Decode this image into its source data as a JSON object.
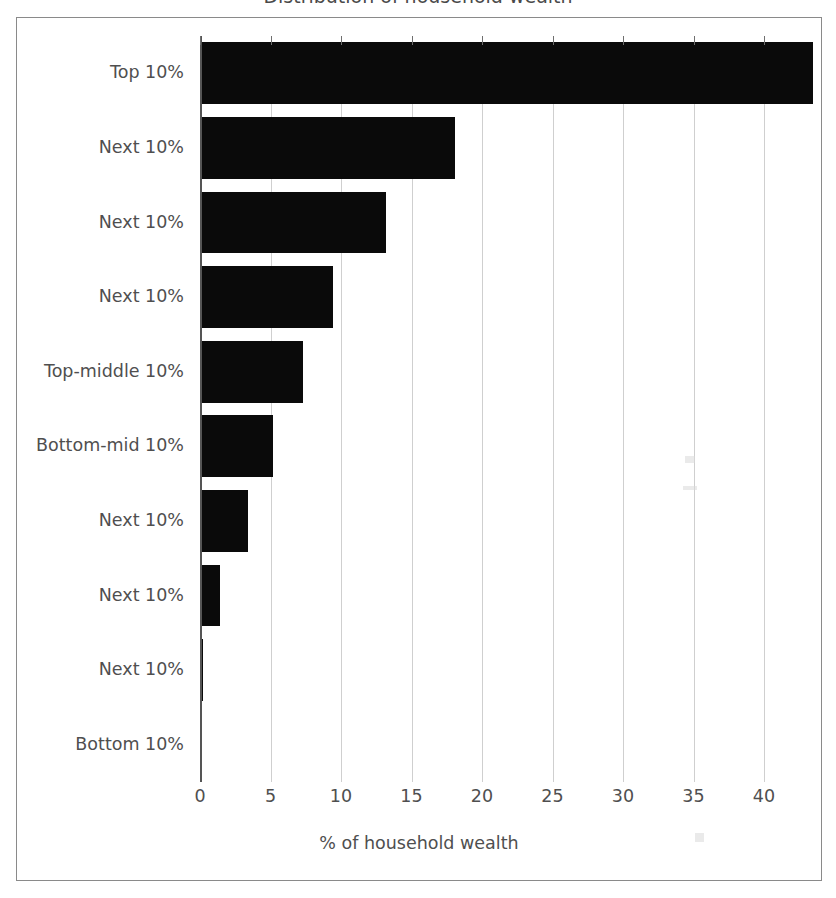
{
  "figure": {
    "clipped_title": "Distribution of household wealth",
    "frame_color": "#8a8a8a",
    "bar_color": "#0a0a0a",
    "grid_color": "#cfcfcf",
    "text_color": "#4f4f4f"
  },
  "axis": {
    "x_title": "% of household wealth",
    "x_ticks": [
      "0",
      "5",
      "10",
      "15",
      "20",
      "25",
      "30",
      "35",
      "40"
    ]
  },
  "chart_data": {
    "type": "bar",
    "orientation": "horizontal",
    "title": "",
    "xlabel": "% of household wealth",
    "ylabel": "",
    "xlim": [
      0,
      44
    ],
    "grid": true,
    "legend": "none",
    "categories": [
      "Top 10%",
      "Next 10%",
      "Next 10%",
      "Next 10%",
      "Top-middle 10%",
      "Bottom-mid 10%",
      "Next 10%",
      "Next 10%",
      "Next 10%",
      "Bottom 10%"
    ],
    "values": [
      43.5,
      18.1,
      13.2,
      9.4,
      7.3,
      5.2,
      3.4,
      1.4,
      0.2,
      0.0
    ],
    "tick_values": [
      0,
      5,
      10,
      15,
      20,
      25,
      30,
      35,
      40
    ]
  }
}
